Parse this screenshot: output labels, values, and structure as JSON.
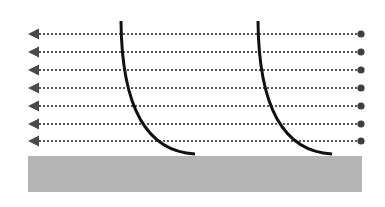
{
  "diagram": {
    "canvas": {
      "width": 385,
      "height": 207
    },
    "colors": {
      "background": "#ffffff",
      "ground": "#b4b4b4",
      "flow_line": "#585858",
      "arrow_head": "#4a4a4a",
      "source_dot": "#3e3e3e",
      "curve": "#111111"
    },
    "flow_lines": [
      {
        "y": 34,
        "x_start": 361,
        "x_end": 28,
        "direction": "left"
      },
      {
        "y": 52,
        "x_start": 361,
        "x_end": 28,
        "direction": "left"
      },
      {
        "y": 70,
        "x_start": 361,
        "x_end": 28,
        "direction": "left"
      },
      {
        "y": 88,
        "x_start": 361,
        "x_end": 28,
        "direction": "left"
      },
      {
        "y": 106,
        "x_start": 361,
        "x_end": 28,
        "direction": "left"
      },
      {
        "y": 124,
        "x_start": 361,
        "x_end": 28,
        "direction": "left"
      },
      {
        "y": 141,
        "x_start": 361,
        "x_end": 28,
        "direction": "left"
      }
    ],
    "curves": [
      {
        "start": [
          121,
          21
        ],
        "control": [
          122,
          150
        ],
        "end": [
          195,
          154
        ]
      },
      {
        "start": [
          258,
          21
        ],
        "control": [
          259,
          150
        ],
        "end": [
          332,
          154
        ]
      }
    ],
    "ground": {
      "x": 28,
      "y": 156,
      "width": 334,
      "height": 36
    }
  }
}
